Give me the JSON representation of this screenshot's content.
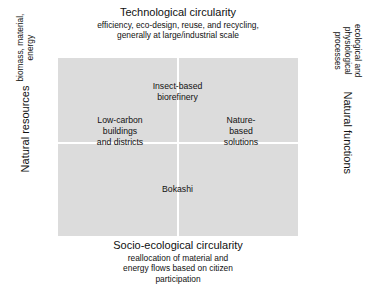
{
  "figure": {
    "type": "2x2-quadrant-matrix",
    "background_color": "#ffffff",
    "plot_fill_color": "#dcdcdc",
    "axis_line_color": "#ffffff",
    "text_color": "#111111"
  },
  "axes": {
    "top": {
      "title": "Technological circularity",
      "subtitle": "efficiency, eco-design, reuse, and recycling,\ngenerally at large/industrial scale"
    },
    "bottom": {
      "title": "Socio-ecological circularity",
      "subtitle": "reallocation of material and\nenergy flows based on citizen\nparticipation"
    },
    "left": {
      "title": "Natural resources",
      "subtitle": "biomass, material,\nenergy"
    },
    "right": {
      "title": "Natural functions",
      "subtitle": "ecological and\nphysiological processes"
    }
  },
  "items": [
    {
      "label": "Insect-based\nbiorefinery",
      "quadrant": "top-center"
    },
    {
      "label": "Low-carbon\nbuildings\nand districts",
      "quadrant": "left-center"
    },
    {
      "label": "Nature-\nbased\nsolutions",
      "quadrant": "right-center"
    },
    {
      "label": "Bokashi",
      "quadrant": "bottom-center"
    }
  ]
}
